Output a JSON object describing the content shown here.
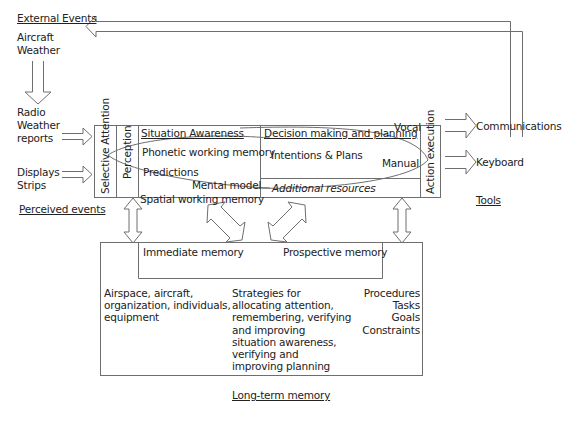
{
  "external": {
    "title": "External Events",
    "items": [
      "Aircraft",
      "Weather"
    ]
  },
  "inputs": {
    "radio": [
      "Radio",
      "Weather",
      "reports"
    ],
    "displays": [
      "Displays",
      "Strips"
    ],
    "perceived_label": "Perceived events"
  },
  "columns": {
    "selective_attention": "Selective Attention",
    "perception": "Perception",
    "action_execution": "Action execution"
  },
  "situation": {
    "title": "Situation Awareness",
    "phonetic": "Phonetic working memory",
    "predictions": "Predictions",
    "mental_model": "Mental model",
    "spatial": "Spatial working memory"
  },
  "decision": {
    "title": "Decision making and planning",
    "intentions": "Intentions & Plans",
    "vocal": "Vocal",
    "manual": "Manual",
    "additional": "Additional resources"
  },
  "outputs": {
    "communications": "Communications",
    "keyboard": "Keyboard",
    "tools_label": "Tools"
  },
  "memory": {
    "immediate": "Immediate memory",
    "prospective": "Prospective memory",
    "col1": [
      "Airspace, aircraft,",
      "organization, individuals,",
      "equipment"
    ],
    "col2": [
      "Strategies for",
      "allocating attention,",
      "remembering, verifying",
      "and improving",
      "situation awareness,",
      "verifying and",
      "improving planning"
    ],
    "col3": [
      "Procedures",
      "Tasks",
      "Goals",
      "Constraints"
    ],
    "title": "Long-term memory"
  },
  "colors": {
    "line": "#6e6e6e",
    "text": "#222222"
  }
}
